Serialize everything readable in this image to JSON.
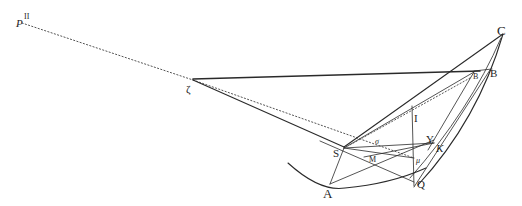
{
  "figure": {
    "type": "geometric-diagram",
    "style": "engraved line drawing",
    "labels": {
      "P": "P",
      "P_superscript": "II",
      "zeta": "ζ",
      "C": "C",
      "B_small": "B",
      "B": "B",
      "I": "I",
      "S": "S",
      "sigma": "σ",
      "M": "M",
      "Y": "Y",
      "K": "K",
      "mu": "μ",
      "A": "A",
      "Q": "Q"
    },
    "colors": {
      "ink": "#2a2a2a",
      "background": "#ffffff"
    }
  }
}
